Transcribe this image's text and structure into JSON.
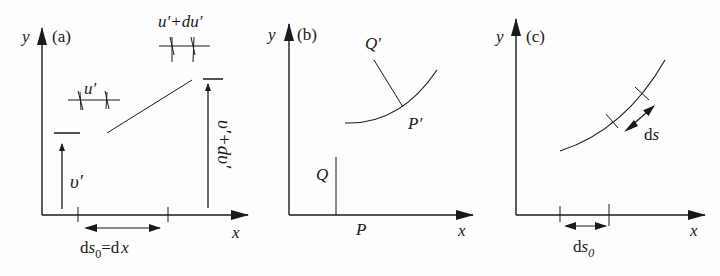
{
  "panels": [
    {
      "id": "a",
      "tag": "(a)",
      "axes": {
        "x": "x",
        "y": "y"
      },
      "labels": {
        "u_prime": "u′",
        "u_prime_du": "u′+du′",
        "v_prime": "υ′",
        "v_prime_dv": "υ′+dυ′",
        "ds0_eq_dx_part1": "ds",
        "ds0_sub": "0",
        "ds0_eq_dx_part2": "=d",
        "ds0_eq_dx_x": "x"
      }
    },
    {
      "id": "b",
      "tag": "(b)",
      "axes": {
        "x": "x",
        "y": "y"
      },
      "labels": {
        "Q": "Q",
        "P": "P",
        "Q_prime": "Q′",
        "P_prime": "P′"
      }
    },
    {
      "id": "c",
      "tag": "(c)",
      "axes": {
        "x": "x",
        "y": "y"
      },
      "labels": {
        "ds": "ds",
        "ds0": "ds",
        "ds0_sub": "0"
      }
    }
  ],
  "colors": {
    "ink": "#1a1a1a",
    "background": "#fdfdfd"
  }
}
